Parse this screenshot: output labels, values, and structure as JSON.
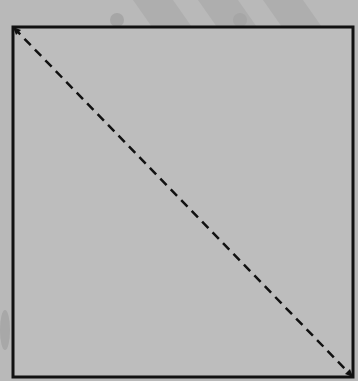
{
  "diagram": {
    "type": "square-with-diagonal",
    "background_color": "#b9b9b9",
    "square_fill": "#bdbdbd",
    "stroke_color": "#111111",
    "square": {
      "x1": 12,
      "y1": 27,
      "x2": 353,
      "y2": 377
    },
    "diagonal": {
      "from": "top-left",
      "to": "bottom-right",
      "style": "dashed"
    },
    "labels": []
  }
}
